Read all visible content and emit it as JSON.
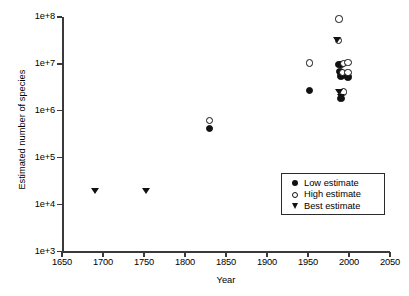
{
  "chart_data": {
    "type": "scatter",
    "title": "",
    "xlabel": "Year",
    "ylabel": "Estimated number of species",
    "xlim": [
      1650,
      2050
    ],
    "ylim": [
      1000,
      100000000
    ],
    "yscale": "log",
    "grid": false,
    "legend_position": "lower right",
    "xticks": [
      1650,
      1700,
      1750,
      1800,
      1850,
      1900,
      1950,
      2000,
      2050
    ],
    "xtick_labels": [
      "1650",
      "1700",
      "1750",
      "1800",
      "1850",
      "1900",
      "1950",
      "2000",
      "2050"
    ],
    "yticks": [
      1000,
      10000,
      100000,
      1000000,
      10000000,
      100000000
    ],
    "ytick_labels": [
      "1e+3",
      "1e+4",
      "1e+5",
      "1e+6",
      "1e+7",
      "1e+8"
    ],
    "series": [
      {
        "name": "Low estimate",
        "marker": "filled-circle",
        "points": [
          {
            "x": 1830,
            "y": 420000
          },
          {
            "x": 1952,
            "y": 2700000
          },
          {
            "x": 1988,
            "y": 9800000
          },
          {
            "x": 1990,
            "y": 9600000
          },
          {
            "x": 1989,
            "y": 6900000
          },
          {
            "x": 1990,
            "y": 5500000
          },
          {
            "x": 1998,
            "y": 5400000
          },
          {
            "x": 1999,
            "y": 5300000
          },
          {
            "x": 1990,
            "y": 1800000
          }
        ]
      },
      {
        "name": "High estimate",
        "marker": "open-circle",
        "points": [
          {
            "x": 1830,
            "y": 620000
          },
          {
            "x": 1952,
            "y": 10500000
          },
          {
            "x": 1988,
            "y": 90000000
          },
          {
            "x": 1987,
            "y": 32000000
          },
          {
            "x": 1993,
            "y": 10300000
          },
          {
            "x": 1999,
            "y": 10600000
          },
          {
            "x": 1992,
            "y": 6600000
          },
          {
            "x": 1999,
            "y": 6500000
          },
          {
            "x": 1993,
            "y": 2500000
          }
        ]
      },
      {
        "name": "Best estimate",
        "marker": "filled-triangle-down",
        "points": [
          {
            "x": 1690,
            "y": 19000
          },
          {
            "x": 1752,
            "y": 19500
          },
          {
            "x": 1985,
            "y": 31000000
          },
          {
            "x": 1988,
            "y": 2500000
          },
          {
            "x": 1990,
            "y": 1900000
          }
        ]
      }
    ]
  },
  "legend": {
    "items": [
      {
        "label": "Low estimate",
        "marker": "filled-circle"
      },
      {
        "label": "High estimate",
        "marker": "open-circle"
      },
      {
        "label": "Best estimate",
        "marker": "filled-triangle-down"
      }
    ]
  }
}
